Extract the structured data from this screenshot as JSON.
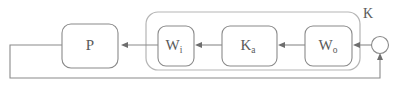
{
  "diagram": {
    "type": "block-diagram",
    "signal_flow": "right-to-left",
    "background_color": "#ffffff",
    "line_color": "#8a8a8a",
    "group_line_color": "#b5b5b5",
    "text_color": "#5a5a5a",
    "blocks": [
      {
        "id": "plant",
        "label_main": "P",
        "label_sub": "",
        "x": 62,
        "y": 24,
        "w": 56,
        "h": 44
      },
      {
        "id": "wi",
        "label_main": "W",
        "label_sub": "i",
        "x": 158,
        "y": 26,
        "w": 36,
        "h": 40
      },
      {
        "id": "ka",
        "label_main": "K",
        "label_sub": "a",
        "x": 222,
        "y": 26,
        "w": 55,
        "h": 40
      },
      {
        "id": "wo",
        "label_main": "W",
        "label_sub": "o",
        "x": 305,
        "y": 26,
        "w": 47,
        "h": 40
      }
    ],
    "group": {
      "id": "controller-group",
      "label": "K",
      "x": 146,
      "y": 12,
      "w": 214,
      "h": 58,
      "label_x": 363,
      "label_y": 14
    },
    "summing_junction": {
      "id": "summing-junction",
      "cx": 380,
      "cy": 45,
      "r": 8.5
    },
    "feedback_path": {
      "description": "output of plant returns along bottom to summing junction",
      "bottom_y": 78,
      "left_x": 10
    },
    "main_line_y": 45
  }
}
